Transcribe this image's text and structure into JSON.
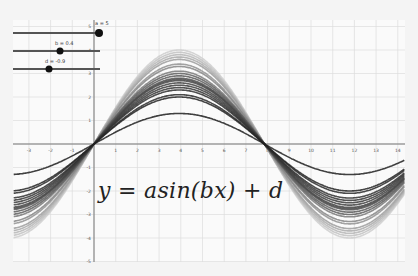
{
  "chart_data": {
    "type": "line",
    "title": "",
    "equation": "y = asin(bx) + d",
    "xlabel": "",
    "ylabel": "",
    "xlim": [
      -3.7,
      14.3
    ],
    "ylim": [
      -5.2,
      5.2
    ],
    "grid": true,
    "x_ticks": [
      -3,
      -2,
      -1,
      1,
      2,
      3,
      4,
      5,
      6,
      7,
      8,
      9,
      10,
      11,
      12,
      13,
      14
    ],
    "y_ticks": [
      -5,
      -4,
      -3,
      -2,
      -1,
      1,
      2,
      3,
      4,
      5
    ],
    "family": {
      "formula": "a*sin(b*x)",
      "b": 0.4,
      "a_values": [
        1.3,
        2.0,
        2.1,
        2.3,
        2.4,
        2.5,
        2.6,
        2.7,
        2.75,
        2.8,
        2.9,
        3.0,
        3.1,
        3.3,
        3.4,
        3.6,
        3.7,
        3.8,
        3.9,
        4.0
      ],
      "dark_series_max_index": 11
    },
    "sliders": [
      {
        "name": "a",
        "label": "a = 5",
        "value": 5
      },
      {
        "name": "b",
        "label": "b = 0.4",
        "value": 0.4
      },
      {
        "name": "d",
        "label": "d = -0.9",
        "value": -0.9
      }
    ]
  },
  "sliders": {
    "a_label": "a = 5",
    "b_label": "b = 0.4",
    "d_label": "d = -0.9"
  },
  "equation": "y = asin(bx) + d"
}
